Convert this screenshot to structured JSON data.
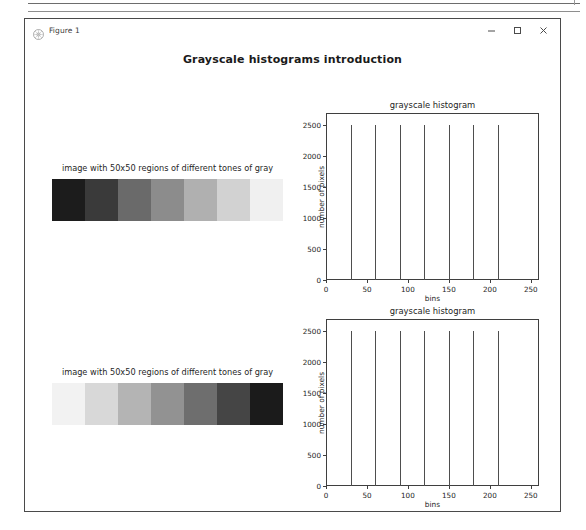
{
  "page": {
    "background": "#ffffff",
    "rule_color": "#6d6d6d"
  },
  "window": {
    "title": "Figure 1",
    "icon": "matplotlib-figure-icon",
    "controls": [
      {
        "name": "minimize",
        "glyph": "minimize-icon"
      },
      {
        "name": "maximize",
        "glyph": "maximize-icon"
      },
      {
        "name": "close",
        "glyph": "close-icon"
      }
    ]
  },
  "figure": {
    "suptitle": "Grayscale histograms introduction"
  },
  "panels": [
    {
      "title": "image with 50x50 regions of different tones of gray",
      "name": "grayscale-strip-ascending",
      "bands": [
        "#1c1c1c",
        "#3a3a3a",
        "#6a6a6a",
        "#8c8c8c",
        "#b0b0b0",
        "#d2d2d2",
        "#f0f0f0"
      ]
    },
    {
      "title": "image with 50x50 regions of different tones of gray",
      "name": "grayscale-strip-descending",
      "bands": [
        "#f2f2f2",
        "#d8d8d8",
        "#b4b4b4",
        "#929292",
        "#6e6e6e",
        "#454545",
        "#1b1b1b"
      ]
    }
  ],
  "chart_data": [
    {
      "type": "bar",
      "name": "grayscale-histogram-top",
      "title": "grayscale histogram",
      "xlabel": "bins",
      "ylabel": "number of pixels",
      "xlim": [
        0,
        260
      ],
      "ylim": [
        0,
        2700
      ],
      "xticks": [
        0,
        50,
        100,
        150,
        200,
        250
      ],
      "yticks": [
        0,
        500,
        1000,
        1500,
        2000,
        2500
      ],
      "xtick_labels": [
        "0",
        "50",
        "100",
        "150",
        "200",
        "250"
      ],
      "ytick_labels": [
        "0",
        "500",
        "1000",
        "1500",
        "2000",
        "2500"
      ],
      "grid": false,
      "legend": null,
      "x": [
        30,
        60,
        90,
        120,
        150,
        180,
        210
      ],
      "values": [
        2500,
        2500,
        2500,
        2500,
        2500,
        2500,
        2500
      ],
      "bar_color": "#4e4e4e"
    },
    {
      "type": "bar",
      "name": "grayscale-histogram-bottom",
      "title": "grayscale histogram",
      "xlabel": "bins",
      "ylabel": "number of pixels",
      "xlim": [
        0,
        260
      ],
      "ylim": [
        0,
        2700
      ],
      "xticks": [
        0,
        50,
        100,
        150,
        200,
        250
      ],
      "yticks": [
        0,
        500,
        1000,
        1500,
        2000,
        2500
      ],
      "xtick_labels": [
        "0",
        "50",
        "100",
        "150",
        "200",
        "250"
      ],
      "ytick_labels": [
        "0",
        "500",
        "1000",
        "1500",
        "2000",
        "2500"
      ],
      "grid": false,
      "legend": null,
      "x": [
        30,
        60,
        90,
        120,
        150,
        180,
        210
      ],
      "values": [
        2500,
        2500,
        2500,
        2500,
        2500,
        2500,
        2500
      ],
      "bar_color": "#4e4e4e"
    }
  ]
}
